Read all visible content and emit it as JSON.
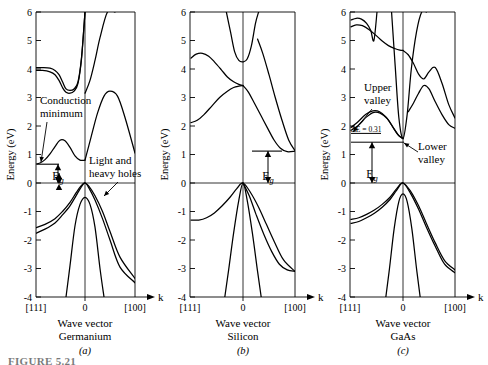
{
  "figure": {
    "caption_label": "FIGURE 5.21",
    "axis_y_label": "Energy (eV)",
    "axis_x_arrow_label": "k",
    "x_tick_left": "[111]",
    "x_tick_center": "0",
    "x_tick_right": "[100]",
    "x_axis_title": "Wave vector",
    "y_ticks": [
      "6",
      "5",
      "4",
      "3",
      "2",
      "1",
      "0",
      "-1",
      "-2",
      "-3",
      "-4"
    ],
    "y_tick_values": [
      6,
      5,
      4,
      3,
      2,
      1,
      0,
      -1,
      -2,
      -3,
      -4
    ]
  },
  "panels": [
    {
      "id": "germanium",
      "material": "Germanium",
      "sublabel": "(a)",
      "annotations": [
        {
          "name": "conduction-minimum",
          "text_line1": "Conduction",
          "text_line2": "minimum"
        },
        {
          "name": "band-gap",
          "text": "E",
          "sub": "g"
        },
        {
          "name": "light-heavy-holes",
          "text_line1": "Light and",
          "text_line2": "heavy holes"
        }
      ]
    },
    {
      "id": "silicon",
      "material": "Silicon",
      "sublabel": "(b)",
      "annotations": [
        {
          "name": "band-gap",
          "text": "E",
          "sub": "g"
        }
      ]
    },
    {
      "id": "gaas",
      "material": "GaAs",
      "sublabel": "(c)",
      "annotations": [
        {
          "name": "upper-valley",
          "text_line1": "Upper",
          "text_line2": "valley"
        },
        {
          "name": "lower-valley",
          "text_line1": "Lower",
          "text_line2": "valley"
        },
        {
          "name": "delta-e",
          "text": "ΔE = 0.31"
        },
        {
          "name": "band-gap",
          "text": "E",
          "sub": "g"
        }
      ]
    }
  ],
  "chart_data": {
    "type": "line",
    "xlabel": "Wave vector",
    "ylabel": "Energy (eV)",
    "ylim": [
      -4,
      6
    ],
    "xticklabels": [
      "[111]",
      "0",
      "[100]"
    ],
    "grid": false,
    "legend": "none",
    "panels": [
      {
        "name": "Germanium",
        "sublabel": "(a)",
        "band_gap_eV": 0.66,
        "conduction_min_eV": 0.66,
        "conduction_min_location": "[111] zone edge (L point)",
        "valence_max_eV": 0.0,
        "valence_max_location": "0 (Gamma point)",
        "gamma_conduction_eV": 0.8,
        "series": [
          {
            "name": "cb-heavy-111-plateau",
            "x": [
              -1.0,
              -0.85,
              -0.7,
              -0.6,
              -0.52,
              -0.45,
              -0.38,
              -0.3,
              -0.22,
              -0.14,
              -0.07,
              0.0
            ],
            "y": [
              4.05,
              4.05,
              4.03,
              3.95,
              3.8,
              3.55,
              3.3,
              3.25,
              3.3,
              3.55,
              4.4,
              6.0
            ]
          },
          {
            "name": "cb-light-111-plateau",
            "x": [
              -1.0,
              -0.85,
              -0.7,
              -0.6,
              -0.52,
              -0.45,
              -0.38,
              -0.3,
              -0.22,
              -0.14,
              -0.07,
              0.0
            ],
            "y": [
              3.95,
              3.95,
              3.9,
              3.8,
              3.6,
              3.35,
              3.18,
              3.15,
              3.22,
              3.5,
              4.35,
              6.0
            ]
          },
          {
            "name": "cb-minimum-band",
            "x": [
              -1.0,
              -0.9,
              -0.8,
              -0.7,
              -0.6,
              -0.5,
              -0.4,
              -0.3,
              -0.2,
              -0.1,
              0.0
            ],
            "y": [
              0.66,
              0.7,
              0.82,
              1.02,
              1.28,
              1.5,
              1.48,
              1.25,
              0.95,
              0.8,
              0.8
            ]
          },
          {
            "name": "cb-gamma-upper-right",
            "x": [
              0.0,
              0.12,
              0.25,
              0.38,
              0.5,
              0.65,
              0.8,
              1.0
            ],
            "y": [
              0.8,
              1.6,
              2.45,
              3.05,
              3.22,
              3.05,
              2.3,
              1.05
            ]
          },
          {
            "name": "cb-right-rise",
            "x": [
              0.0,
              0.1,
              0.2,
              0.3,
              0.45,
              0.6
            ],
            "y": [
              3.15,
              3.6,
              4.3,
              5.1,
              6.0,
              6.0
            ]
          },
          {
            "name": "vb-heavy-hole",
            "x": [
              -1.0,
              -0.8,
              -0.6,
              -0.45,
              -0.3,
              -0.18,
              -0.08,
              0.0,
              0.08,
              0.2,
              0.35,
              0.5,
              0.7,
              1.0
            ],
            "y": [
              -1.58,
              -1.45,
              -1.25,
              -1.0,
              -0.68,
              -0.35,
              -0.1,
              0.0,
              -0.12,
              -0.45,
              -1.0,
              -1.7,
              -2.6,
              -3.35
            ]
          },
          {
            "name": "vb-light-hole",
            "x": [
              -1.0,
              -0.8,
              -0.6,
              -0.45,
              -0.3,
              -0.18,
              -0.08,
              0.0,
              0.08,
              0.2,
              0.35,
              0.5,
              0.7,
              1.0
            ],
            "y": [
              -1.78,
              -1.62,
              -1.4,
              -1.12,
              -0.8,
              -0.45,
              -0.15,
              0.0,
              -0.18,
              -0.6,
              -1.25,
              -2.0,
              -2.95,
              -3.5
            ]
          },
          {
            "name": "vb-split-off",
            "x": [
              -0.38,
              -0.3,
              -0.2,
              -0.1,
              0.0,
              0.1,
              0.2,
              0.3,
              0.38
            ],
            "y": [
              -4.0,
              -2.9,
              -1.5,
              -0.75,
              -0.5,
              -0.75,
              -1.55,
              -3.0,
              -4.0
            ]
          }
        ]
      },
      {
        "name": "Silicon",
        "sublabel": "(b)",
        "band_gap_eV": 1.12,
        "conduction_min_eV": 1.12,
        "conduction_min_location": "near [100] (X point, ~0.85 of the way)",
        "valence_max_eV": 0.0,
        "valence_max_location": "0 (Gamma point)",
        "gamma_conduction_eV": 4.2,
        "series": [
          {
            "name": "cb-111-hump",
            "x": [
              -1.0,
              -0.9,
              -0.78,
              -0.66,
              -0.55,
              -0.42,
              -0.3,
              -0.18,
              -0.08,
              0.0
            ],
            "y": [
              4.38,
              4.52,
              4.55,
              4.45,
              4.25,
              3.98,
              3.72,
              3.55,
              3.46,
              3.42
            ]
          },
          {
            "name": "cb-111-lower",
            "x": [
              -1.0,
              -0.88,
              -0.75,
              -0.6,
              -0.45,
              -0.3,
              -0.18,
              -0.08,
              0.0
            ],
            "y": [
              2.12,
              2.2,
              2.4,
              2.7,
              3.0,
              3.22,
              3.35,
              3.4,
              3.42
            ]
          },
          {
            "name": "cb-gamma-valley",
            "x": [
              -0.32,
              -0.24,
              -0.16,
              -0.08,
              0.0,
              0.08,
              0.16,
              0.24,
              0.3
            ],
            "y": [
              6.0,
              5.3,
              4.6,
              4.3,
              4.25,
              4.35,
              4.8,
              5.6,
              6.0
            ]
          },
          {
            "name": "cb-x-minimum",
            "x": [
              0.0,
              0.1,
              0.22,
              0.35,
              0.48,
              0.6,
              0.72,
              0.85,
              1.0
            ],
            "y": [
              3.42,
              3.2,
              2.8,
              2.35,
              1.9,
              1.5,
              1.22,
              1.1,
              1.12
            ]
          },
          {
            "name": "cb-upper-cross",
            "x": [
              0.28,
              0.38,
              0.5,
              0.62,
              0.75,
              0.88,
              1.0
            ],
            "y": [
              5.05,
              4.55,
              3.8,
              3.0,
              2.2,
              1.5,
              1.14
            ]
          },
          {
            "name": "vb-heavy-hole",
            "x": [
              -1.0,
              -0.85,
              -0.7,
              -0.55,
              -0.4,
              -0.25,
              -0.12,
              0.0,
              0.15,
              0.3,
              0.45,
              0.6,
              0.78,
              1.0
            ],
            "y": [
              -1.3,
              -1.3,
              -1.22,
              -1.05,
              -0.8,
              -0.5,
              -0.2,
              0.0,
              -0.35,
              -0.85,
              -1.45,
              -2.05,
              -2.7,
              -3.1
            ]
          },
          {
            "name": "vb-light-hole",
            "x": [
              0.0,
              0.12,
              0.25,
              0.4,
              0.55,
              0.7,
              0.85,
              1.0
            ],
            "y": [
              0.0,
              -0.45,
              -1.1,
              -1.8,
              -2.4,
              -2.85,
              -3.05,
              -3.1
            ]
          },
          {
            "name": "vb-split-off",
            "x": [
              -0.35,
              -0.28,
              -0.18,
              -0.08,
              0.0,
              0.08,
              0.18,
              0.28,
              0.35
            ],
            "y": [
              -4.0,
              -3.1,
              -1.75,
              -0.6,
              0.0,
              -0.6,
              -1.75,
              -3.1,
              -4.0
            ]
          }
        ]
      },
      {
        "name": "GaAs",
        "sublabel": "(c)",
        "band_gap_eV": 1.43,
        "conduction_min_eV": 1.43,
        "conduction_min_location": "0 (Gamma point, direct gap, lower valley)",
        "valence_max_eV": 0.0,
        "valence_max_location": "0 (Gamma point)",
        "upper_valley_eV": 1.74,
        "valley_separation_eV": 0.31,
        "series": [
          {
            "name": "cb-top-upper",
            "x": [
              -1.0,
              -0.9,
              -0.8,
              -0.7,
              -0.62,
              -0.56,
              -0.5
            ],
            "y": [
              5.72,
              5.78,
              5.75,
              5.6,
              5.35,
              5.0,
              6.0
            ]
          },
          {
            "name": "cb-top-lower",
            "x": [
              -1.0,
              -0.9,
              -0.78,
              -0.65,
              -0.52,
              -0.4,
              -0.28,
              -0.16,
              -0.06,
              0.0
            ],
            "y": [
              5.48,
              5.55,
              5.52,
              5.38,
              5.18,
              4.98,
              4.82,
              4.72,
              4.66,
              4.65
            ]
          },
          {
            "name": "cb-upper-valley-band",
            "x": [
              -1.0,
              -0.88,
              -0.72,
              -0.58,
              -0.45,
              -0.32,
              -0.2,
              -0.1,
              0.0
            ],
            "y": [
              1.95,
              2.12,
              2.4,
              2.53,
              2.5,
              2.3,
              1.98,
              1.7,
              1.56
            ]
          },
          {
            "name": "cb-upper-valley-band2",
            "x": [
              -1.0,
              -0.86,
              -0.7,
              -0.56,
              -0.44,
              -0.3,
              -0.18,
              -0.08,
              0.0
            ],
            "y": [
              1.85,
              2.02,
              2.32,
              2.48,
              2.45,
              2.25,
              1.92,
              1.66,
              1.56
            ]
          },
          {
            "name": "cb-gamma-lower-valley",
            "x": [
              -0.22,
              -0.15,
              -0.08,
              0.0,
              0.08,
              0.16,
              0.26,
              0.36,
              0.45
            ],
            "y": [
              6.0,
              4.1,
              2.3,
              1.56,
              2.4,
              4.0,
              5.3,
              6.0,
              6.0
            ]
          },
          {
            "name": "cb-right-wiggle-upper",
            "x": [
              0.0,
              0.1,
              0.2,
              0.3,
              0.4,
              0.5,
              0.62,
              0.75,
              0.88,
              1.0
            ],
            "y": [
              4.65,
              4.5,
              4.2,
              3.82,
              3.65,
              3.9,
              4.05,
              3.5,
              2.75,
              2.28
            ]
          },
          {
            "name": "cb-right-wiggle-lower",
            "x": [
              0.1,
              0.2,
              0.3,
              0.4,
              0.5,
              0.62,
              0.75,
              0.88,
              1.0
            ],
            "y": [
              2.5,
              2.8,
              3.15,
              3.42,
              3.3,
              2.85,
              2.4,
              2.05,
              1.92
            ]
          },
          {
            "name": "vb-heavy-hole",
            "x": [
              -1.0,
              -0.85,
              -0.7,
              -0.55,
              -0.4,
              -0.25,
              -0.12,
              0.0,
              0.15,
              0.3,
              0.45,
              0.62,
              0.8,
              1.0
            ],
            "y": [
              -1.28,
              -1.22,
              -1.1,
              -0.95,
              -0.75,
              -0.5,
              -0.2,
              0.0,
              -0.3,
              -0.8,
              -1.42,
              -2.1,
              -2.72,
              -3.05
            ]
          },
          {
            "name": "vb-light-hole",
            "x": [
              -1.0,
              -0.85,
              -0.7,
              -0.55,
              -0.4,
              -0.25,
              -0.12,
              0.0,
              0.15,
              0.3,
              0.45,
              0.62,
              0.8,
              1.0
            ],
            "y": [
              -1.42,
              -1.35,
              -1.22,
              -1.06,
              -0.85,
              -0.58,
              -0.25,
              0.0,
              -0.38,
              -0.92,
              -1.55,
              -2.22,
              -2.85,
              -3.15
            ]
          },
          {
            "name": "vb-split-off",
            "x": [
              -0.33,
              -0.26,
              -0.17,
              -0.08,
              0.0,
              0.08,
              0.17,
              0.26,
              0.33
            ],
            "y": [
              -4.0,
              -3.0,
              -1.6,
              -0.65,
              -0.38,
              -0.65,
              -1.6,
              -3.0,
              -4.0
            ]
          }
        ]
      }
    ]
  }
}
